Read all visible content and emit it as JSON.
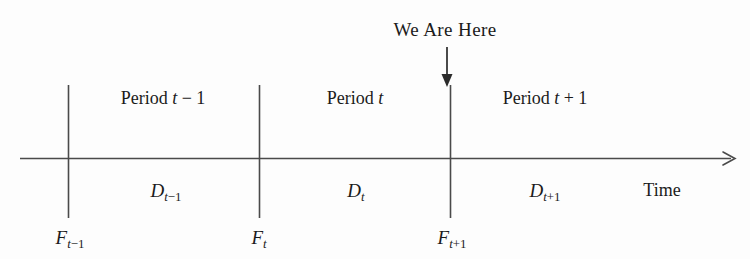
{
  "figure": {
    "type": "timeline-diagram",
    "background_color": "#fdfdfd",
    "line_color": "#4a4a4a",
    "text_color": "#1b1b1b"
  },
  "callout": {
    "label": "We Are Here",
    "arrow": "down-arrow",
    "points_to_tick": 3,
    "x": 445,
    "label_y": 20,
    "arrow_top_y": 48,
    "arrow_bottom_y": 86
  },
  "axis": {
    "name": "Time",
    "direction": "right",
    "y": 158,
    "x_start": 20,
    "x_end": 737,
    "name_x": 662,
    "name_y": 181,
    "arrowhead": "right-arrow"
  },
  "ticks": [
    {
      "id": "tick-1",
      "x": 68,
      "top_y": 85,
      "bottom_y": 218
    },
    {
      "id": "tick-2",
      "x": 259,
      "top_y": 85,
      "bottom_y": 218
    },
    {
      "id": "tick-3",
      "x": 450,
      "top_y": 85,
      "bottom_y": 218
    }
  ],
  "periods": [
    {
      "id": "period-t-minus-1",
      "base": "Period",
      "variable": "t",
      "operator": "−",
      "offset": "1",
      "x": 163,
      "y": 89
    },
    {
      "id": "period-t",
      "base": "Period",
      "variable": "t",
      "operator": "",
      "offset": "",
      "x": 355,
      "y": 89
    },
    {
      "id": "period-t-plus-1",
      "base": "Period",
      "variable": "t",
      "operator": "+",
      "offset": "1",
      "x": 545,
      "y": 89
    }
  ],
  "demands": [
    {
      "id": "demand-t-minus-1",
      "symbol": "D",
      "subscript_variable": "t",
      "subscript_operator": "−",
      "subscript_offset": "1",
      "x": 166,
      "y": 181
    },
    {
      "id": "demand-t",
      "symbol": "D",
      "subscript_variable": "t",
      "subscript_operator": "",
      "subscript_offset": "",
      "x": 356,
      "y": 181
    },
    {
      "id": "demand-t-plus-1",
      "symbol": "D",
      "subscript_variable": "t",
      "subscript_operator": "+",
      "subscript_offset": "1",
      "x": 545,
      "y": 181
    }
  ],
  "forecasts": [
    {
      "id": "forecast-t-minus-1",
      "symbol": "F",
      "subscript_variable": "t",
      "subscript_operator": "−",
      "subscript_offset": "1",
      "x": 70,
      "y": 228
    },
    {
      "id": "forecast-t",
      "symbol": "F",
      "subscript_variable": "t",
      "subscript_operator": "",
      "subscript_offset": "",
      "x": 259,
      "y": 228
    },
    {
      "id": "forecast-t-plus-1",
      "symbol": "F",
      "subscript_variable": "t",
      "subscript_operator": "+",
      "subscript_offset": "1",
      "x": 452,
      "y": 228
    }
  ]
}
